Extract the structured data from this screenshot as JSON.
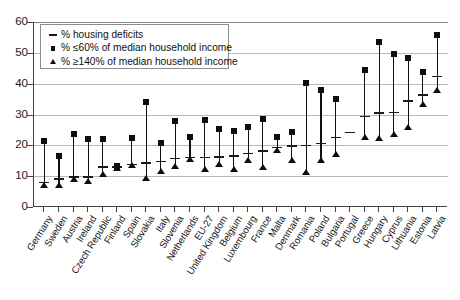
{
  "chart_data": {
    "type": "scatter",
    "title": "",
    "subtitle": "",
    "xlabel": "",
    "ylabel": "",
    "ylim": [
      0,
      60
    ],
    "yticks": [
      0,
      10,
      20,
      30,
      40,
      50,
      60
    ],
    "grid": true,
    "legend_position": "top-left",
    "legend": [
      "% housing deficits",
      "% ≤60% of median household income",
      "% ≥140% of median household income"
    ],
    "categories": [
      "Germany",
      "Sweden",
      "Austria",
      "Ireland",
      "Czech Republic",
      "Finland",
      "Spain",
      "Slovakia",
      "Italy",
      "Slovenia",
      "Netherlands",
      "EU-27",
      "United Kingdom",
      "Belgium",
      "Luxembourg",
      "France",
      "Malta",
      "Denmark",
      "Romania",
      "Poland",
      "Bulgaria",
      "Portugal",
      "Greece",
      "Hungary",
      "Cyprus",
      "Lithuania",
      "Estonia",
      "Latvia"
    ],
    "series": [
      {
        "name": "% housing deficits",
        "marker": "dash",
        "values": [
          8.0,
          9.0,
          9.8,
          9.8,
          13.0,
          13.0,
          13.8,
          14.3,
          14.7,
          15.7,
          16.0,
          16.1,
          16.3,
          16.5,
          17.3,
          18.2,
          19.3,
          19.8,
          19.9,
          20.6,
          22.5,
          24.1,
          29.4,
          30.5,
          30.6,
          34.3,
          36.3,
          42.3
        ]
      },
      {
        "name": "% ≤60% of median household income",
        "marker": "square",
        "values": [
          21.5,
          16.7,
          23.8,
          22.2,
          22.2,
          13.3,
          22.5,
          34.2,
          20.8,
          27.9,
          22.8,
          28.2,
          25.4,
          24.5,
          26.1,
          28.5,
          22.8,
          24.3,
          40.1,
          37.9,
          35.1,
          null,
          44.3,
          53.4,
          49.6,
          48.3,
          43.9,
          55.7
        ]
      },
      {
        "name": "% ≥140% of median household income",
        "marker": "triangle",
        "values": [
          7.0,
          7.0,
          9.2,
          8.4,
          10.7,
          12.8,
          13.5,
          9.4,
          11.6,
          13.2,
          15.5,
          12.4,
          14.0,
          12.4,
          15.1,
          12.9,
          18.5,
          15.2,
          11.2,
          15.1,
          17.1,
          null,
          22.8,
          22.5,
          23.7,
          26.1,
          33.5,
          37.8
        ]
      }
    ]
  },
  "axis": {
    "y_tick_labels": [
      "0",
      "10",
      "20",
      "30",
      "40",
      "50",
      "60"
    ]
  }
}
